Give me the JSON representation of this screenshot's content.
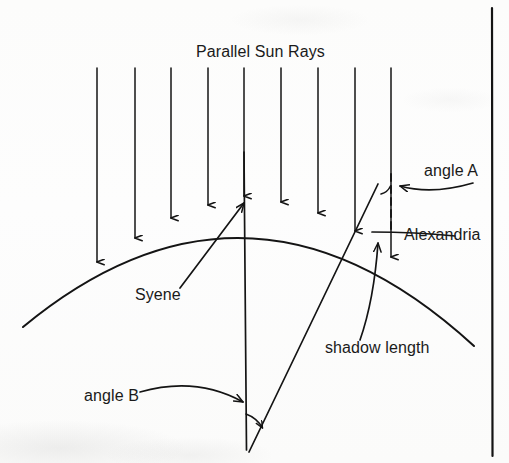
{
  "diagram": {
    "background_color": "#fdfdfc",
    "ink_color": "#141414",
    "labels": {
      "sun_rays": "Parallel Sun Rays",
      "angle_a": "angle A",
      "angle_b": "angle B",
      "alexandria": "Alexandria",
      "syene": "Syene",
      "shadow_length": "shadow length"
    },
    "label_positions": {
      "sun_rays": {
        "x": 196,
        "y": 57
      },
      "angle_a": {
        "x": 424,
        "y": 176
      },
      "angle_b": {
        "x": 84,
        "y": 401
      },
      "alexandria": {
        "x": 404,
        "y": 240
      },
      "syene": {
        "x": 135,
        "y": 300
      },
      "shadow_length": {
        "x": 325,
        "y": 353
      }
    },
    "sun_rays": {
      "count": 9,
      "label": "Parallel Sun Rays",
      "direction": "downward",
      "x_positions": [
        97,
        135,
        171,
        208,
        244,
        281,
        318,
        355,
        391
      ],
      "y_start": 68,
      "y_end_values": [
        262,
        238,
        218,
        205,
        196,
        202,
        213,
        231,
        257
      ]
    },
    "earth_arc": {
      "name": "earth-surface-arc",
      "left_end": {
        "x": 23,
        "y": 327
      },
      "apex": {
        "x": 249,
        "y": 191
      },
      "right_end": {
        "x": 474,
        "y": 346
      }
    },
    "syene_radius_line": {
      "name": "syene-radius",
      "top": {
        "x": 244,
        "y": 152
      },
      "bottom": {
        "x": 246,
        "y": 449
      }
    },
    "alexandria_radius_line": {
      "name": "alexandria-radius",
      "top": {
        "x": 378,
        "y": 184
      },
      "bottom": {
        "x": 249,
        "y": 452
      }
    },
    "gnomon_dashed_line": {
      "name": "alexandria-vertical-dashed",
      "top": {
        "x": 391,
        "y": 174
      },
      "bottom": {
        "x": 391,
        "y": 229
      },
      "style": "dashed"
    },
    "angle_a_marker": {
      "name": "angle-a-arc",
      "vertex": {
        "x": 385,
        "y": 180
      }
    },
    "angle_b_marker": {
      "name": "angle-b-arc",
      "vertex": {
        "x": 246,
        "y": 449
      }
    },
    "leader_lines": [
      {
        "name": "angle-a-leader",
        "from": {
          "x": 470,
          "y": 186
        },
        "to": {
          "x": 397,
          "y": 186
        }
      },
      {
        "name": "angle-b-leader",
        "from": {
          "x": 140,
          "y": 392
        },
        "to": {
          "x": 248,
          "y": 401
        }
      },
      {
        "name": "alexandria-leader",
        "from": {
          "x": 455,
          "y": 232
        },
        "to": {
          "x": 372,
          "y": 232
        }
      },
      {
        "name": "syene-leader",
        "from": {
          "x": 180,
          "y": 288
        },
        "to": {
          "x": 245,
          "y": 202
        }
      },
      {
        "name": "shadow-length-leader",
        "from": {
          "x": 360,
          "y": 340
        },
        "to": {
          "x": 378,
          "y": 242
        }
      }
    ],
    "border_line": {
      "name": "page-border-right",
      "x": 492,
      "y_top": 8,
      "y_bottom": 456
    }
  }
}
